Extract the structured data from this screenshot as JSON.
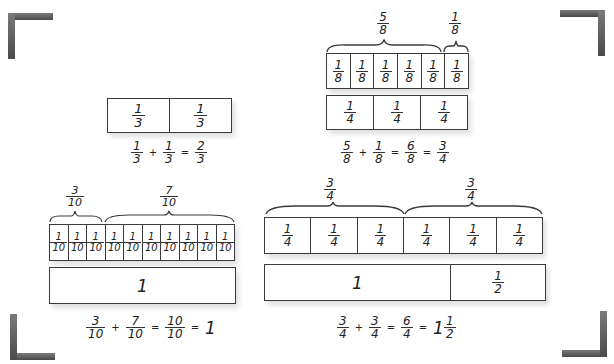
{
  "corners": [
    "top-left",
    "top-right",
    "bottom-left",
    "bottom-right"
  ],
  "colors": {
    "ink": "#3a3a3a",
    "corner": "#5a5a5a"
  },
  "thirds": {
    "cells": [
      {
        "n": "1",
        "d": "3"
      },
      {
        "n": "1",
        "d": "3"
      }
    ],
    "equation": [
      {
        "n": "1",
        "d": "3"
      },
      "+",
      {
        "n": "1",
        "d": "3"
      },
      "=",
      {
        "n": "2",
        "d": "3"
      }
    ]
  },
  "eighths": {
    "brace_left": {
      "n": "5",
      "d": "8"
    },
    "brace_right": {
      "n": "1",
      "d": "8"
    },
    "top_cells": [
      {
        "n": "1",
        "d": "8"
      },
      {
        "n": "1",
        "d": "8"
      },
      {
        "n": "1",
        "d": "8"
      },
      {
        "n": "1",
        "d": "8"
      },
      {
        "n": "1",
        "d": "8"
      },
      {
        "n": "1",
        "d": "8"
      }
    ],
    "bottom_cells": [
      {
        "n": "1",
        "d": "4"
      },
      {
        "n": "1",
        "d": "4"
      },
      {
        "n": "1",
        "d": "4"
      }
    ],
    "equation": [
      {
        "n": "5",
        "d": "8"
      },
      "+",
      {
        "n": "1",
        "d": "8"
      },
      "=",
      {
        "n": "6",
        "d": "8"
      },
      "=",
      {
        "n": "3",
        "d": "4"
      }
    ]
  },
  "tenths": {
    "brace_left": {
      "n": "3",
      "d": "10"
    },
    "brace_right": {
      "n": "7",
      "d": "10"
    },
    "top_cells": [
      {
        "n": "1",
        "d": "10"
      },
      {
        "n": "1",
        "d": "10"
      },
      {
        "n": "1",
        "d": "10"
      },
      {
        "n": "1",
        "d": "10"
      },
      {
        "n": "1",
        "d": "10"
      },
      {
        "n": "1",
        "d": "10"
      },
      {
        "n": "1",
        "d": "10"
      },
      {
        "n": "1",
        "d": "10"
      },
      {
        "n": "1",
        "d": "10"
      },
      {
        "n": "1",
        "d": "10"
      }
    ],
    "bottom_label": "1",
    "equation": [
      {
        "n": "3",
        "d": "10"
      },
      "+",
      {
        "n": "7",
        "d": "10"
      },
      "=",
      {
        "n": "10",
        "d": "10"
      },
      "=",
      "1"
    ]
  },
  "quarters": {
    "brace_left": {
      "n": "3",
      "d": "4"
    },
    "brace_right": {
      "n": "3",
      "d": "4"
    },
    "top_cells": [
      {
        "n": "1",
        "d": "4"
      },
      {
        "n": "1",
        "d": "4"
      },
      {
        "n": "1",
        "d": "4"
      },
      {
        "n": "1",
        "d": "4"
      },
      {
        "n": "1",
        "d": "4"
      },
      {
        "n": "1",
        "d": "4"
      }
    ],
    "bottom_whole": "1",
    "bottom_half": {
      "n": "1",
      "d": "2"
    },
    "equation": [
      {
        "n": "3",
        "d": "4"
      },
      "+",
      {
        "n": "3",
        "d": "4"
      },
      "=",
      {
        "n": "6",
        "d": "4"
      },
      "=",
      {
        "whole": "1",
        "n": "1",
        "d": "2"
      }
    ]
  }
}
